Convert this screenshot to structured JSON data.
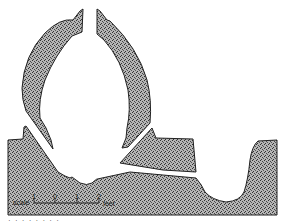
{
  "figure": {
    "type": "cross-section drawing",
    "fill_color": "#8c8c8c",
    "outline_color": "#222222",
    "background": "#ffffff"
  },
  "scale_bar": {
    "label": "scale",
    "ticks": [
      "1",
      "0",
      "1",
      "2"
    ],
    "unit": "feet"
  },
  "caption": {
    "text": "· · · · · · · ·"
  }
}
